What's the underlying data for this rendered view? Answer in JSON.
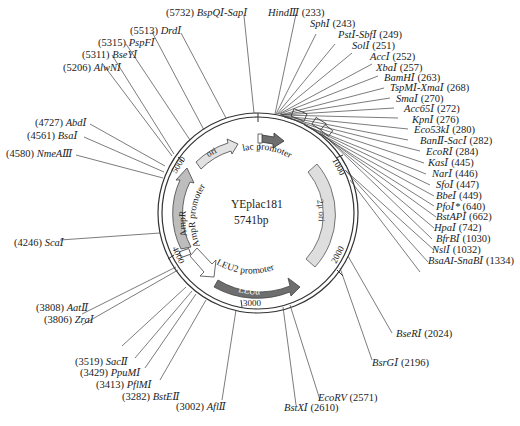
{
  "plasmid": {
    "name": "YEplac181",
    "size_label": "5741bp",
    "size_bp": 5741
  },
  "colors": {
    "line": "#333333",
    "feature_light": "#dcdcdc",
    "feature_mid": "#bdbdbd",
    "feature_dark": "#6e6e6e",
    "feature_white": "#ffffff"
  },
  "ticks": [
    {
      "label": "1000"
    },
    {
      "label": "2000"
    },
    {
      "label": "3000"
    },
    {
      "label": "4000"
    },
    {
      "label": "5000"
    }
  ],
  "features": [
    {
      "name": "ori",
      "label": "ori"
    },
    {
      "name": "lac-promoter",
      "label": "lac promoter"
    },
    {
      "name": "lacZa",
      "label": "lacZα"
    },
    {
      "name": "2u-ori",
      "label": "2μ ori"
    },
    {
      "name": "leu2-promoter",
      "label": "LEU2 promoter"
    },
    {
      "name": "leu2",
      "label": "LEUα"
    },
    {
      "name": "ampr",
      "label": "AmpR"
    },
    {
      "name": "ampr-promoter",
      "label": "AmpR promoter"
    }
  ],
  "sites": [
    {
      "pos": "5732",
      "enzyme": "BspQⅠ-SapⅠ"
    },
    {
      "pos": "5513",
      "enzyme": "DrdⅠ"
    },
    {
      "pos": "5315",
      "enzyme": "PspFⅠ"
    },
    {
      "pos": "5311",
      "enzyme": "BseYⅠ"
    },
    {
      "pos": "5206",
      "enzyme": "AlwNⅠ"
    },
    {
      "pos": "4727",
      "enzyme": "AbdⅠ"
    },
    {
      "pos": "4561",
      "enzyme": "BsaⅠ"
    },
    {
      "pos": "4580",
      "enzyme": "NmeAⅢ"
    },
    {
      "pos": "4246",
      "enzyme": "ScaⅠ"
    },
    {
      "pos": "3808",
      "enzyme": "AatⅡ"
    },
    {
      "pos": "3806",
      "enzyme": "ZraⅠ"
    },
    {
      "pos": "3519",
      "enzyme": "SacⅡ"
    },
    {
      "pos": "3429",
      "enzyme": "PpuMⅠ"
    },
    {
      "pos": "3413",
      "enzyme": "PflMⅠ"
    },
    {
      "pos": "3282",
      "enzyme": "BstEⅡ"
    },
    {
      "pos": "3002",
      "enzyme": "AflⅡ"
    },
    {
      "pos": "233",
      "enzyme": "HindⅢ"
    },
    {
      "pos": "243",
      "enzyme": "SphⅠ"
    },
    {
      "pos": "249",
      "enzyme": "PstⅠ-SbfⅠ"
    },
    {
      "pos": "251",
      "enzyme": "SolⅠ"
    },
    {
      "pos": "252",
      "enzyme": "AccⅠ"
    },
    {
      "pos": "257",
      "enzyme": "XbaⅠ"
    },
    {
      "pos": "263",
      "enzyme": "BamHⅠ"
    },
    {
      "pos": "268",
      "enzyme": "TspMⅠ-XmaⅠ"
    },
    {
      "pos": "270",
      "enzyme": "SmaⅠ"
    },
    {
      "pos": "272",
      "enzyme": "Acc65Ⅰ"
    },
    {
      "pos": "276",
      "enzyme": "KpnⅠ"
    },
    {
      "pos": "280",
      "enzyme": "Eco53kⅠ"
    },
    {
      "pos": "282",
      "enzyme": "BanⅡ-SacⅠ"
    },
    {
      "pos": "284",
      "enzyme": "EcoRⅠ"
    },
    {
      "pos": "445",
      "enzyme": "KasⅠ"
    },
    {
      "pos": "446",
      "enzyme": "NarⅠ"
    },
    {
      "pos": "447",
      "enzyme": "SfoⅠ"
    },
    {
      "pos": "449",
      "enzyme": "BbeⅠ"
    },
    {
      "pos": "640",
      "enzyme": "PfoⅠ*"
    },
    {
      "pos": "662",
      "enzyme": "BstAPⅠ"
    },
    {
      "pos": "742",
      "enzyme": "HpaⅠ"
    },
    {
      "pos": "1030",
      "enzyme": "BfrBⅠ"
    },
    {
      "pos": "1032",
      "enzyme": "NslⅠ"
    },
    {
      "pos": "1334",
      "enzyme": "BsaAI-SnaBⅠ"
    },
    {
      "pos": "2024",
      "enzyme": "BseRⅠ"
    },
    {
      "pos": "2196",
      "enzyme": "BsrGⅠ"
    },
    {
      "pos": "2571",
      "enzyme": "EcoRV"
    },
    {
      "pos": "2610",
      "enzyme": "BstXⅠ"
    }
  ]
}
